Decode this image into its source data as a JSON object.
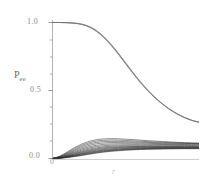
{
  "chart_data": {
    "type": "line",
    "title": "",
    "subtitle": "",
    "xlabel": "r",
    "ylabel": "P",
    "ylabel_subscript": "ee",
    "ylabel_full": "P_ee",
    "xlim": [
      0,
      1
    ],
    "ylim": [
      0.0,
      1.05
    ],
    "y_ticks_major": [
      "1.0",
      "0.5",
      "0.0"
    ],
    "y_tick_values": [
      1.0,
      0.5,
      0.0
    ],
    "y_minor_tick_count": 4,
    "x_ticks": [
      "0"
    ],
    "x_tick_values": [
      0
    ],
    "grid": false,
    "legend": false,
    "legend_position": "none",
    "axis_color": "#b4b4b4",
    "curve_color": "#3c3c3c",
    "background": "#ffffff",
    "x": [
      0.0,
      0.05,
      0.1,
      0.15,
      0.2,
      0.25,
      0.3,
      0.35,
      0.4,
      0.45,
      0.5,
      0.55,
      0.6,
      0.65,
      0.7,
      0.75,
      0.8,
      0.85,
      0.9,
      0.95,
      1.0
    ],
    "series": [
      {
        "name": "survival-upper-1",
        "group": "upper",
        "values": [
          1.0,
          1.0,
          0.999,
          0.996,
          0.988,
          0.971,
          0.941,
          0.897,
          0.84,
          0.774,
          0.703,
          0.632,
          0.565,
          0.504,
          0.45,
          0.403,
          0.363,
          0.33,
          0.303,
          0.282,
          0.268
        ]
      },
      {
        "name": "survival-upper-2",
        "group": "upper",
        "values": [
          1.0,
          1.0,
          0.998,
          0.994,
          0.985,
          0.966,
          0.934,
          0.889,
          0.831,
          0.765,
          0.694,
          0.624,
          0.558,
          0.498,
          0.445,
          0.399,
          0.36,
          0.327,
          0.3,
          0.28,
          0.265
        ]
      },
      {
        "name": "survival-upper-3",
        "group": "upper",
        "values": [
          1.0,
          1.0,
          0.999,
          0.995,
          0.987,
          0.969,
          0.938,
          0.894,
          0.836,
          0.77,
          0.699,
          0.629,
          0.562,
          0.501,
          0.448,
          0.401,
          0.362,
          0.329,
          0.302,
          0.281,
          0.267
        ]
      },
      {
        "name": "transition-1",
        "group": "lower",
        "values": [
          0.0,
          0.018,
          0.048,
          0.08,
          0.106,
          0.126,
          0.138,
          0.144,
          0.146,
          0.145,
          0.142,
          0.139,
          0.135,
          0.131,
          0.128,
          0.125,
          0.122,
          0.119,
          0.117,
          0.115,
          0.113
        ]
      },
      {
        "name": "transition-2",
        "group": "lower",
        "values": [
          0.0,
          0.015,
          0.042,
          0.072,
          0.097,
          0.116,
          0.128,
          0.134,
          0.136,
          0.135,
          0.133,
          0.13,
          0.127,
          0.124,
          0.121,
          0.119,
          0.117,
          0.115,
          0.113,
          0.112,
          0.111
        ]
      },
      {
        "name": "transition-3",
        "group": "lower",
        "values": [
          0.0,
          0.013,
          0.037,
          0.064,
          0.088,
          0.106,
          0.118,
          0.124,
          0.126,
          0.126,
          0.124,
          0.122,
          0.12,
          0.118,
          0.116,
          0.114,
          0.113,
          0.112,
          0.111,
          0.11,
          0.109
        ]
      },
      {
        "name": "transition-4",
        "group": "lower",
        "values": [
          0.0,
          0.011,
          0.032,
          0.057,
          0.079,
          0.096,
          0.108,
          0.114,
          0.117,
          0.117,
          0.116,
          0.115,
          0.113,
          0.112,
          0.11,
          0.109,
          0.108,
          0.107,
          0.106,
          0.106,
          0.105
        ]
      },
      {
        "name": "transition-5",
        "group": "lower",
        "values": [
          0.0,
          0.01,
          0.028,
          0.05,
          0.07,
          0.086,
          0.097,
          0.104,
          0.107,
          0.108,
          0.108,
          0.107,
          0.106,
          0.105,
          0.104,
          0.103,
          0.103,
          0.102,
          0.102,
          0.101,
          0.101
        ]
      },
      {
        "name": "transition-6",
        "group": "lower",
        "values": [
          0.0,
          0.008,
          0.024,
          0.044,
          0.062,
          0.077,
          0.088,
          0.094,
          0.098,
          0.099,
          0.1,
          0.1,
          0.099,
          0.099,
          0.098,
          0.098,
          0.097,
          0.097,
          0.097,
          0.096,
          0.096
        ]
      },
      {
        "name": "transition-7",
        "group": "lower",
        "values": [
          0.0,
          0.007,
          0.021,
          0.038,
          0.055,
          0.069,
          0.079,
          0.086,
          0.09,
          0.092,
          0.093,
          0.093,
          0.093,
          0.093,
          0.093,
          0.092,
          0.092,
          0.092,
          0.092,
          0.091,
          0.091
        ]
      },
      {
        "name": "transition-8",
        "group": "lower",
        "values": [
          0.0,
          0.006,
          0.018,
          0.034,
          0.049,
          0.062,
          0.072,
          0.079,
          0.083,
          0.086,
          0.087,
          0.088,
          0.088,
          0.088,
          0.088,
          0.088,
          0.088,
          0.088,
          0.088,
          0.087,
          0.087
        ]
      },
      {
        "name": "transition-9",
        "group": "lower",
        "values": [
          0.0,
          0.005,
          0.016,
          0.03,
          0.044,
          0.056,
          0.066,
          0.073,
          0.078,
          0.081,
          0.083,
          0.084,
          0.085,
          0.085,
          0.085,
          0.085,
          0.085,
          0.085,
          0.085,
          0.085,
          0.084
        ]
      },
      {
        "name": "transition-10",
        "group": "lower",
        "values": [
          0.0,
          0.004,
          0.014,
          0.026,
          0.039,
          0.051,
          0.06,
          0.067,
          0.072,
          0.076,
          0.078,
          0.08,
          0.081,
          0.081,
          0.082,
          0.082,
          0.082,
          0.082,
          0.082,
          0.082,
          0.082
        ]
      },
      {
        "name": "transition-11",
        "group": "lower",
        "values": [
          0.0,
          0.004,
          0.012,
          0.023,
          0.035,
          0.046,
          0.055,
          0.062,
          0.067,
          0.071,
          0.074,
          0.076,
          0.077,
          0.078,
          0.079,
          0.079,
          0.079,
          0.079,
          0.079,
          0.079,
          0.079
        ]
      },
      {
        "name": "transition-12",
        "group": "lower",
        "values": [
          0.0,
          0.003,
          0.011,
          0.021,
          0.032,
          0.042,
          0.051,
          0.058,
          0.063,
          0.067,
          0.07,
          0.072,
          0.074,
          0.075,
          0.076,
          0.076,
          0.077,
          0.077,
          0.077,
          0.077,
          0.077
        ]
      },
      {
        "name": "transition-13",
        "group": "lower",
        "values": [
          0.0,
          0.003,
          0.009,
          0.018,
          0.028,
          0.038,
          0.047,
          0.054,
          0.059,
          0.063,
          0.067,
          0.069,
          0.071,
          0.072,
          0.073,
          0.074,
          0.074,
          0.075,
          0.075,
          0.075,
          0.075
        ]
      },
      {
        "name": "transition-14",
        "group": "lower",
        "values": [
          0.0,
          0.002,
          0.008,
          0.016,
          0.025,
          0.035,
          0.043,
          0.05,
          0.056,
          0.06,
          0.064,
          0.066,
          0.068,
          0.07,
          0.071,
          0.072,
          0.073,
          0.073,
          0.074,
          0.074,
          0.074
        ]
      },
      {
        "name": "transition-15",
        "group": "lower",
        "values": [
          0.0,
          0.002,
          0.007,
          0.014,
          0.022,
          0.031,
          0.04,
          0.047,
          0.053,
          0.057,
          0.061,
          0.064,
          0.066,
          0.068,
          0.069,
          0.07,
          0.071,
          0.072,
          0.072,
          0.072,
          0.073
        ]
      }
    ]
  },
  "axes": {
    "y_label_text": "P",
    "y_label_sub": "ee",
    "x_label_text": "r",
    "tick_1_0": "1.0",
    "tick_0_5": "0.5",
    "tick_0_0": "0.0",
    "tick_origin": "0"
  }
}
